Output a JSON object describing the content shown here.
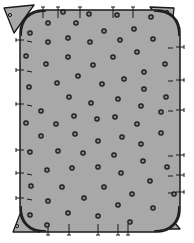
{
  "illustration": {
    "subject": "Rounded rectangular gray pad with scattered ring holes and stitched edges, with triangular corner pieces",
    "colors": {
      "background": "#ffffff",
      "fill": "#a8a8a8",
      "stroke": "#1a1a1a"
    },
    "body": {
      "x": 20,
      "y": 10,
      "width": 160,
      "height": 222,
      "radius": 22
    },
    "corner_pieces": [
      {
        "name": "top-left",
        "points": "4,8 34,5 14,33"
      },
      {
        "name": "top-right",
        "points": "150,7 174,8 171,36"
      },
      {
        "name": "bottom-left",
        "points": "20,214 13,232 40,232"
      },
      {
        "name": "bottom-right",
        "points": "165,211 155,229 180,229"
      }
    ],
    "holes": [
      [
        63,
        12
      ],
      [
        89,
        14
      ],
      [
        117,
        15
      ],
      [
        151,
        17
      ],
      [
        48,
        23
      ],
      [
        76,
        23
      ],
      [
        104,
        31
      ],
      [
        134,
        29
      ],
      [
        30,
        33
      ],
      [
        68,
        38
      ],
      [
        48,
        42
      ],
      [
        90,
        42
      ],
      [
        120,
        40
      ],
      [
        153,
        39
      ],
      [
        26,
        56
      ],
      [
        68,
        57
      ],
      [
        113,
        57
      ],
      [
        137,
        52
      ],
      [
        46,
        64
      ],
      [
        93,
        65
      ],
      [
        165,
        64
      ],
      [
        144,
        72
      ],
      [
        78,
        76
      ],
      [
        124,
        79
      ],
      [
        57,
        83
      ],
      [
        102,
        84
      ],
      [
        29,
        87
      ],
      [
        144,
        89
      ],
      [
        69,
        97
      ],
      [
        118,
        99
      ],
      [
        166,
        97
      ],
      [
        91,
        103
      ],
      [
        141,
        106
      ],
      [
        41,
        111
      ],
      [
        161,
        112
      ],
      [
        74,
        116
      ],
      [
        115,
        117
      ],
      [
        97,
        119
      ],
      [
        26,
        123
      ],
      [
        56,
        124
      ],
      [
        137,
        124
      ],
      [
        75,
        134
      ],
      [
        161,
        133
      ],
      [
        41,
        136
      ],
      [
        122,
        137
      ],
      [
        98,
        141
      ],
      [
        141,
        144
      ],
      [
        30,
        152
      ],
      [
        58,
        151
      ],
      [
        83,
        153
      ],
      [
        114,
        155
      ],
      [
        143,
        161
      ],
      [
        47,
        170
      ],
      [
        72,
        168
      ],
      [
        98,
        167
      ],
      [
        121,
        173
      ],
      [
        167,
        167
      ],
      [
        31,
        186
      ],
      [
        62,
        187
      ],
      [
        104,
        187
      ],
      [
        150,
        181
      ],
      [
        84,
        198
      ],
      [
        48,
        201
      ],
      [
        132,
        194
      ],
      [
        174,
        194
      ],
      [
        118,
        205
      ],
      [
        153,
        208
      ],
      [
        68,
        213
      ],
      [
        98,
        216
      ],
      [
        30,
        215
      ],
      [
        130,
        222
      ],
      [
        47,
        225
      ]
    ],
    "corner_holes": [
      [
        10,
        15
      ],
      [
        167,
        12
      ],
      [
        17,
        226
      ],
      [
        168,
        223
      ]
    ],
    "ticks_top": [
      43,
      58,
      80,
      113,
      133
    ],
    "ticks_bottom": [
      48,
      69,
      98,
      118,
      128
    ],
    "ticks_left": [
      40,
      70,
      104,
      150,
      173,
      198
    ],
    "ticks_right": [
      47,
      80,
      110,
      155,
      175,
      192
    ]
  }
}
